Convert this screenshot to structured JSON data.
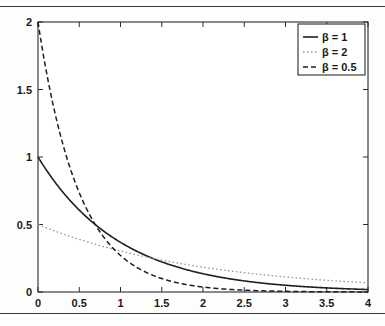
{
  "figure": {
    "background_color": "#fdfdfd",
    "axis_color": "#2b2b2b",
    "rule_color": "#3a3a3a"
  },
  "chart_data": {
    "type": "line",
    "title": "",
    "xlabel": "",
    "ylabel": "",
    "xlim": [
      0,
      4
    ],
    "ylim": [
      0,
      2
    ],
    "grid": false,
    "legend_position": "top-right",
    "x_ticks": [
      "0",
      "0.5",
      "1",
      "1.5",
      "2",
      "2.5",
      "3",
      "3.5",
      "4"
    ],
    "x_tick_values": [
      0,
      0.5,
      1,
      1.5,
      2,
      2.5,
      3,
      3.5,
      4
    ],
    "y_ticks": [
      "0",
      "0.5",
      "1",
      "1.5",
      "2"
    ],
    "y_tick_values": [
      0,
      0.5,
      1,
      1.5,
      2
    ],
    "function": "(1/beta) * exp(-x/beta)",
    "series": [
      {
        "name": "β = 1",
        "beta": 1,
        "linestyle": "solid",
        "color": "#1f1f1f",
        "width": 1.6,
        "x": [
          0,
          0.2,
          0.4,
          0.6,
          0.8,
          1.0,
          1.2,
          1.4,
          1.6,
          1.8,
          2.0,
          2.2,
          2.4,
          2.6,
          2.8,
          3.0,
          3.2,
          3.4,
          3.6,
          3.8,
          4.0
        ],
        "values": [
          1.0,
          0.819,
          0.67,
          0.549,
          0.449,
          0.368,
          0.301,
          0.247,
          0.202,
          0.165,
          0.135,
          0.111,
          0.091,
          0.074,
          0.061,
          0.05,
          0.041,
          0.033,
          0.027,
          0.022,
          0.018
        ]
      },
      {
        "name": "β = 2",
        "beta": 2,
        "linestyle": "dotted",
        "color": "#9a9a9a",
        "width": 1.3,
        "x": [
          0,
          0.2,
          0.4,
          0.6,
          0.8,
          1.0,
          1.2,
          1.4,
          1.6,
          1.8,
          2.0,
          2.2,
          2.4,
          2.6,
          2.8,
          3.0,
          3.2,
          3.4,
          3.6,
          3.8,
          4.0
        ],
        "values": [
          0.5,
          0.452,
          0.409,
          0.37,
          0.335,
          0.303,
          0.274,
          0.248,
          0.225,
          0.203,
          0.184,
          0.166,
          0.151,
          0.136,
          0.123,
          0.112,
          0.101,
          0.091,
          0.083,
          0.075,
          0.068
        ]
      },
      {
        "name": "β = 0.5",
        "beta": 0.5,
        "linestyle": "dashed",
        "color": "#1f1f1f",
        "width": 1.5,
        "x": [
          0,
          0.2,
          0.4,
          0.6,
          0.8,
          1.0,
          1.2,
          1.4,
          1.6,
          1.8,
          2.0,
          2.2,
          2.4,
          2.6,
          2.8,
          3.0,
          3.2,
          3.4,
          3.6,
          3.8,
          4.0
        ],
        "values": [
          2.0,
          1.341,
          0.899,
          0.602,
          0.404,
          0.271,
          0.181,
          0.122,
          0.082,
          0.055,
          0.037,
          0.025,
          0.016,
          0.011,
          0.007,
          0.005,
          0.003,
          0.002,
          0.0015,
          0.001,
          0.0007
        ]
      }
    ]
  }
}
